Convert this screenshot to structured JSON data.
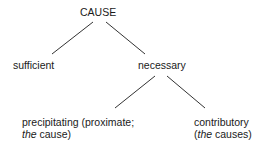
{
  "diagram": {
    "root": "CAUSE",
    "level1": {
      "left": "sufficient",
      "right": "necessary"
    },
    "level2": {
      "left": {
        "line1": "precipitating (proximate;",
        "line2_em": "the",
        "line2_rest": " cause)"
      },
      "right": {
        "line1": "contributory",
        "line2_pre": "(",
        "line2_em": "the",
        "line2_rest": " causes)"
      }
    }
  }
}
